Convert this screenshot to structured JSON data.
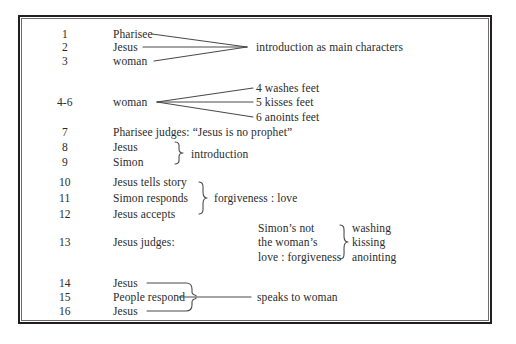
{
  "diagram": {
    "type": "outline-bracket-diagram",
    "frame": {
      "border_color": "#231f20"
    },
    "text_color": "#2b2b2b",
    "line_color": "#4a4a4a",
    "rows": [
      {
        "number": "1",
        "label": "Pharisee"
      },
      {
        "number": "2",
        "label": "Jesus"
      },
      {
        "number": "3",
        "label": "woman"
      },
      {
        "number": "4-6",
        "label": "woman"
      },
      {
        "number": "7",
        "label": "Pharisee judges: “Jesus is no prophet”"
      },
      {
        "number": "8",
        "label": "Jesus"
      },
      {
        "number": "9",
        "label": "Simon"
      },
      {
        "number": "10",
        "label": "Jesus tells story"
      },
      {
        "number": "11",
        "label": "Simon responds"
      },
      {
        "number": "12",
        "label": "Jesus accepts"
      },
      {
        "number": "13",
        "label": "Jesus judges:"
      },
      {
        "number": "14",
        "label": "Jesus"
      },
      {
        "number": "15",
        "label": "People respond"
      },
      {
        "number": "16",
        "label": "Jesus"
      }
    ],
    "annotations": {
      "group1_result": "introduction as main characters",
      "woman_actions": [
        "4 washes feet",
        "5 kisses feet",
        "6 anoints feet"
      ],
      "introduction": "introduction",
      "forgiveness_love": "forgiveness : love",
      "judgment_left": [
        "Simon’s not",
        "the woman’s",
        "love : forgiveness"
      ],
      "judgment_right": [
        "washing",
        "kissing",
        "anointing"
      ],
      "speaks_to_woman": "speaks to woman"
    }
  }
}
